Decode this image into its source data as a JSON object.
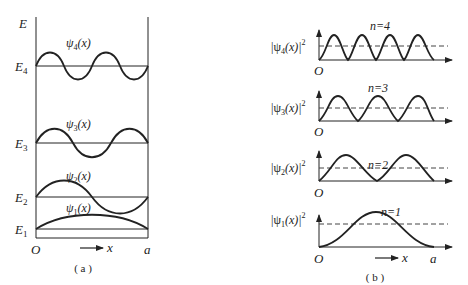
{
  "panel_a": {
    "caption": "( a )",
    "y_axis_label": "E",
    "origin_label": "O",
    "x_label": "x",
    "right_wall_label": "a",
    "levels": [
      {
        "n": 4,
        "energy_label": "E",
        "energy_sub": "4",
        "psi_label": "ψ",
        "psi_sub": "4",
        "psi_arg": "(x)"
      },
      {
        "n": 3,
        "energy_label": "E",
        "energy_sub": "3",
        "psi_label": "ψ",
        "psi_sub": "3",
        "psi_arg": "(x)"
      },
      {
        "n": 2,
        "energy_label": "E",
        "energy_sub": "2",
        "psi_label": "ψ",
        "psi_sub": "2",
        "psi_arg": "(x)"
      },
      {
        "n": 1,
        "energy_label": "E",
        "energy_sub": "1",
        "psi_label": "ψ",
        "psi_sub": "1",
        "psi_arg": "(x)"
      }
    ]
  },
  "panel_b": {
    "caption": "( b )",
    "origin_label": "O",
    "x_label": "x",
    "right_wall_label": "a",
    "plots": [
      {
        "n": 4,
        "n_label": "n=4",
        "y_label_pre": "|ψ",
        "y_sub": "4",
        "y_label_post": "(x)|",
        "y_sup": "2"
      },
      {
        "n": 3,
        "n_label": "n=3",
        "y_label_pre": "|ψ",
        "y_sub": "3",
        "y_label_post": "(x)|",
        "y_sup": "2"
      },
      {
        "n": 2,
        "n_label": "n=2",
        "y_label_pre": "|ψ",
        "y_sub": "2",
        "y_label_post": "(x)|",
        "y_sup": "2"
      },
      {
        "n": 1,
        "n_label": "n=1",
        "y_label_pre": "|ψ",
        "y_sub": "1",
        "y_label_post": "(x)|",
        "y_sup": "2"
      }
    ]
  },
  "colors": {
    "stroke": "#222222",
    "background": "#ffffff"
  }
}
